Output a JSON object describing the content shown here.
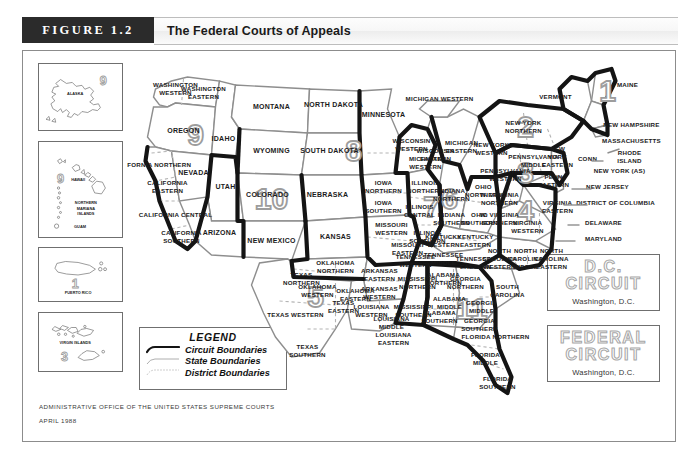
{
  "header": {
    "figure_badge": "FIGURE 1.2",
    "title": "The Federal Courts of Appeals"
  },
  "legend": {
    "title": "LEGEND",
    "items": [
      {
        "label": "Circuit Boundaries",
        "style": "thick-black"
      },
      {
        "label": "State Boundaries",
        "style": "thin-gray"
      },
      {
        "label": "District Boundaries",
        "style": "dotted-gray"
      }
    ]
  },
  "credit": {
    "line1": "ADMINISTRATIVE OFFICE OF THE UNITED STATES SUPREME COURTS",
    "line2": "APRIL 1988"
  },
  "special_circuits": [
    {
      "name_line1": "D.C.",
      "name_line2": "CIRCUIT",
      "location": "Washington, D.C."
    },
    {
      "name_line1": "FEDERAL",
      "name_line2": "CIRCUIT",
      "location": "Washington, D.C."
    }
  ],
  "insets": [
    {
      "id": "alaska",
      "labels": [
        "ALASKA"
      ],
      "circuit": "9"
    },
    {
      "id": "hawaii",
      "labels": [
        "HAWAII",
        "NORTHERN",
        "MARIANA",
        "ISLANDS",
        "GUAM"
      ],
      "circuit": "9"
    },
    {
      "id": "puerto-rico",
      "labels": [
        "PUERTO RICO"
      ],
      "circuit": "1"
    },
    {
      "id": "virgin-islands",
      "labels": [
        "VIRGIN ISLANDS"
      ],
      "circuit": "3"
    }
  ],
  "circuit_numbers_on_map": [
    "1",
    "2",
    "3",
    "4",
    "5",
    "6",
    "7",
    "8",
    "9",
    "10",
    "11"
  ],
  "map_labels": [
    "WASHINGTON WESTERN",
    "WASHINGTON EASTERN",
    "OREGON",
    "IDAHO",
    "MONTANA",
    "NORTH DAKOTA",
    "SOUTH DAKOTA",
    "MINNESOTA",
    "WYOMING",
    "NEBRASKA",
    "NEVADA",
    "UTAH",
    "COLORADO",
    "KANSAS",
    "ARIZONA",
    "NEW MEXICO",
    "CALIFORNIA NORTHERN",
    "CALIFORNIA EASTERN",
    "CALIFORNIA CENTRAL",
    "CALIFORNIA SOUTHERN",
    "IOWA NORTHERN",
    "IOWA SOUTHERN",
    "WISCONSIN WESTERN",
    "WISCONSIN EASTERN",
    "MICHIGAN WESTERN",
    "MICHIGAN EASTERN",
    "ILLINOIS NORTHERN",
    "ILLINOIS CENTRAL",
    "ILLINOIS SOUTHERN",
    "INDIANA NORTHERN",
    "INDIANA SOUTHERN",
    "MISSOURI WESTERN",
    "MISSOURI EASTERN",
    "OHIO NORTHERN",
    "OHIO SOUTHERN",
    "OKLAHOMA NORTHERN",
    "OKLAHOMA WESTERN",
    "OKLAHOMA EASTERN",
    "ARKANSAS WESTERN",
    "ARKANSAS EASTERN",
    "TEXAS NORTHERN",
    "TEXAS WESTERN",
    "TEXAS EASTERN",
    "TEXAS SOUTHERN",
    "LOUISIANA WESTERN",
    "LOUISIANA MIDDLE",
    "LOUISIANA EASTERN",
    "MISSISSIPPI NORTHERN",
    "MISSISSIPPI SOUTHERN",
    "ALABAMA NORTHERN",
    "ALABAMA MIDDLE",
    "ALABAMA SOUTHERN",
    "TENNESSEE WESTERN",
    "TENNESSEE MIDDLE",
    "TENNESSEE EASTERN",
    "KENTUCKY WESTERN",
    "KENTUCKY EASTERN",
    "GEORGIA NORTHERN",
    "GEORGIA MIDDLE",
    "GEORGIA SOUTHERN",
    "FLORIDA NORTHERN",
    "FLORIDA MIDDLE",
    "FLORIDA SOUTHERN",
    "SOUTH CAROLINA",
    "NORTH CAROLINA WESTERN",
    "NORTH CAROLINA MIDDLE",
    "NORTH CAROLINA EASTERN",
    "W. VIRGINIA NORTHERN",
    "W. VIRGINIA SOUTHERN",
    "VIRGINIA WESTERN",
    "VIRGINIA EASTERN",
    "PENNSYLVANIA WESTERN",
    "PENNSYLVANIA MIDDLE",
    "PENN EASTERN",
    "NEW YORK NORTHERN",
    "NEW YORK WESTERN",
    "NEW YORK EASTERN",
    "NEW YORK (AS)",
    "VERMONT",
    "MAINE",
    "NEW HAMPSHIRE",
    "MASSACHUSETTS",
    "CONN",
    "RHODE ISLAND",
    "NEW JERSEY",
    "DISTRICT OF COLUMBIA",
    "DELAWARE",
    "MARYLAND"
  ],
  "colors": {
    "badge_bg": "#2b2b2b",
    "title_bg": "#f4f4f4",
    "frame_border": "#8c8c8c",
    "circuit_boundary": "#141414",
    "state_boundary": "#8e8e8e",
    "district_boundary": "#b4b4b4",
    "circuit_number": "#9d9d9d"
  }
}
